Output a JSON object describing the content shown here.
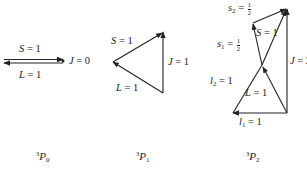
{
  "diagrams": [
    {
      "term": {
        "sup": "3",
        "letter": "P",
        "sub": "0"
      },
      "labels": {
        "S": {
          "sym": "S",
          "eq": " = ",
          "val": "1"
        },
        "L": {
          "sym": "L",
          "eq": " = ",
          "val": "1"
        },
        "J": {
          "sym": "J",
          "eq": " = ",
          "val": "0"
        }
      }
    },
    {
      "term": {
        "sup": "3",
        "letter": "P",
        "sub": "1"
      },
      "labels": {
        "S": {
          "sym": "S",
          "eq": " = ",
          "val": "1"
        },
        "L": {
          "sym": "L",
          "eq": " = ",
          "val": "1"
        },
        "J": {
          "sym": "J",
          "eq": " = ",
          "val": "1"
        }
      }
    },
    {
      "term": {
        "sup": "3",
        "letter": "P",
        "sub": "2"
      },
      "labels": {
        "s2": {
          "sym": "s",
          "sub": "2",
          "eq": " = ",
          "num": "1",
          "den": "2"
        },
        "s1": {
          "sym": "s",
          "sub": "1",
          "eq": " = ",
          "num": "1",
          "den": "2"
        },
        "S": {
          "sym": "S",
          "eq": " = ",
          "val": "1"
        },
        "J": {
          "sym": "J",
          "eq": " = ",
          "val": "2"
        },
        "l2": {
          "sym": "l",
          "sub": "2",
          "eq": " = ",
          "val": "1"
        },
        "L": {
          "sym": "L",
          "eq": " = ",
          "val": "1"
        },
        "l1": {
          "sym": "l",
          "sub": "1",
          "eq": " = ",
          "val": "1"
        }
      }
    }
  ],
  "colors": {
    "ink": "#222222",
    "background": "#ffffff"
  }
}
